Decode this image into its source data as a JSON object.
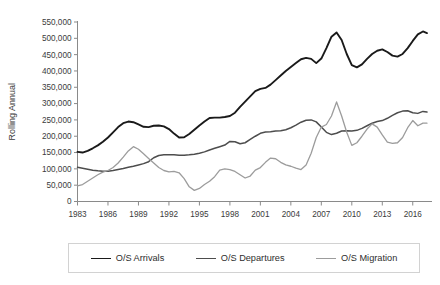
{
  "chart_data": {
    "type": "line",
    "title": "",
    "xlabel": "",
    "ylabel": "Rolling Annual",
    "ylim": [
      0,
      550000
    ],
    "xlim": [
      1983,
      2017.5
    ],
    "grid": false,
    "legend_position": "bottom",
    "y_ticks": [
      "0",
      "50,000",
      "100,000",
      "150,000",
      "200,000",
      "250,000",
      "300,000",
      "350,000",
      "400,000",
      "450,000",
      "500,000",
      "550,000"
    ],
    "y_tick_values": [
      0,
      50000,
      100000,
      150000,
      200000,
      250000,
      300000,
      350000,
      400000,
      450000,
      500000,
      550000
    ],
    "x_ticks": [
      "1983",
      "1986",
      "1989",
      "1992",
      "1995",
      "1998",
      "2001",
      "2004",
      "2007",
      "2010",
      "2013",
      "2016"
    ],
    "x_tick_values": [
      1983,
      1986,
      1989,
      1992,
      1995,
      1998,
      2001,
      2004,
      2007,
      2010,
      2013,
      2016
    ],
    "series": [
      {
        "name": "O/S Arrivals",
        "color": "#1a1a1a",
        "width": 1.9,
        "x": [
          1983.0,
          1983.5,
          1984.0,
          1984.5,
          1985.0,
          1985.5,
          1986.0,
          1986.5,
          1987.0,
          1987.5,
          1988.0,
          1988.5,
          1989.0,
          1989.5,
          1990.0,
          1990.5,
          1991.0,
          1991.5,
          1992.0,
          1992.5,
          1993.0,
          1993.5,
          1994.0,
          1994.5,
          1995.0,
          1995.5,
          1996.0,
          1996.5,
          1997.0,
          1997.5,
          1998.0,
          1998.5,
          1999.0,
          1999.5,
          2000.0,
          2000.5,
          2001.0,
          2001.5,
          2002.0,
          2002.5,
          2003.0,
          2003.5,
          2004.0,
          2004.5,
          2005.0,
          2005.5,
          2006.0,
          2006.5,
          2007.0,
          2007.5,
          2008.0,
          2008.5,
          2009.0,
          2009.5,
          2010.0,
          2010.5,
          2011.0,
          2011.5,
          2012.0,
          2012.5,
          2013.0,
          2013.5,
          2014.0,
          2014.5,
          2015.0,
          2015.5,
          2016.0,
          2016.5,
          2017.0,
          2017.4
        ],
        "y": [
          152000,
          150000,
          155000,
          163000,
          172000,
          183000,
          196000,
          212000,
          228000,
          240000,
          245000,
          243000,
          236000,
          229000,
          228000,
          232000,
          233000,
          230000,
          222000,
          208000,
          196000,
          197000,
          207000,
          220000,
          233000,
          245000,
          256000,
          257000,
          257000,
          259000,
          262000,
          272000,
          290000,
          306000,
          322000,
          338000,
          345000,
          348000,
          358000,
          372000,
          386000,
          400000,
          412000,
          424000,
          436000,
          440000,
          437000,
          424000,
          438000,
          470000,
          505000,
          518000,
          495000,
          452000,
          418000,
          411000,
          420000,
          437000,
          452000,
          462000,
          466000,
          458000,
          447000,
          444000,
          452000,
          470000,
          492000,
          512000,
          521000,
          516000
        ]
      },
      {
        "name": "O/S Departures",
        "color": "#4d4d4d",
        "width": 1.5,
        "x": [
          1983.0,
          1983.5,
          1984.0,
          1984.5,
          1985.0,
          1985.5,
          1986.0,
          1986.5,
          1987.0,
          1987.5,
          1988.0,
          1988.5,
          1989.0,
          1989.5,
          1990.0,
          1990.5,
          1991.0,
          1991.5,
          1992.0,
          1992.5,
          1993.0,
          1993.5,
          1994.0,
          1994.5,
          1995.0,
          1995.5,
          1996.0,
          1996.5,
          1997.0,
          1997.5,
          1998.0,
          1998.5,
          1999.0,
          1999.5,
          2000.0,
          2000.5,
          2001.0,
          2001.5,
          2002.0,
          2002.5,
          2003.0,
          2003.5,
          2004.0,
          2004.5,
          2005.0,
          2005.5,
          2006.0,
          2006.5,
          2007.0,
          2007.5,
          2008.0,
          2008.5,
          2009.0,
          2009.5,
          2010.0,
          2010.5,
          2011.0,
          2011.5,
          2012.0,
          2012.5,
          2013.0,
          2013.5,
          2014.0,
          2014.5,
          2015.0,
          2015.5,
          2016.0,
          2016.5,
          2017.0,
          2017.4
        ],
        "y": [
          105000,
          102000,
          99000,
          96000,
          94000,
          93000,
          93000,
          95000,
          98000,
          101000,
          105000,
          108000,
          112000,
          116000,
          122000,
          134000,
          141000,
          143000,
          143000,
          143000,
          142000,
          142000,
          143000,
          145000,
          148000,
          152000,
          158000,
          163000,
          168000,
          173000,
          184000,
          183000,
          177000,
          180000,
          190000,
          200000,
          209000,
          213000,
          214000,
          216000,
          217000,
          220000,
          226000,
          234000,
          243000,
          249000,
          250000,
          244000,
          228000,
          212000,
          205000,
          209000,
          216000,
          217000,
          216000,
          218000,
          224000,
          232000,
          240000,
          245000,
          248000,
          255000,
          264000,
          272000,
          277000,
          278000,
          272000,
          270000,
          276000,
          274000
        ]
      },
      {
        "name": "O/S Migration",
        "color": "#9c9c9c",
        "width": 1.3,
        "x": [
          1983.0,
          1983.5,
          1984.0,
          1984.5,
          1985.0,
          1985.5,
          1986.0,
          1986.5,
          1987.0,
          1987.5,
          1988.0,
          1988.5,
          1989.0,
          1989.5,
          1990.0,
          1990.5,
          1991.0,
          1991.5,
          1992.0,
          1992.5,
          1993.0,
          1993.5,
          1994.0,
          1994.5,
          1995.0,
          1995.5,
          1996.0,
          1996.5,
          1997.0,
          1997.5,
          1998.0,
          1998.5,
          1999.0,
          1999.5,
          2000.0,
          2000.5,
          2001.0,
          2001.5,
          2002.0,
          2002.5,
          2003.0,
          2003.5,
          2004.0,
          2004.5,
          2005.0,
          2005.5,
          2006.0,
          2006.5,
          2007.0,
          2007.5,
          2008.0,
          2008.5,
          2009.0,
          2009.5,
          2010.0,
          2010.5,
          2011.0,
          2011.5,
          2012.0,
          2012.5,
          2013.0,
          2013.5,
          2014.0,
          2014.5,
          2015.0,
          2015.5,
          2016.0,
          2016.5,
          2017.0,
          2017.4
        ],
        "y": [
          48000,
          52000,
          62000,
          72000,
          82000,
          90000,
          95000,
          104000,
          118000,
          136000,
          155000,
          168000,
          160000,
          146000,
          132000,
          118000,
          104000,
          95000,
          91000,
          92000,
          88000,
          70000,
          45000,
          34000,
          40000,
          52000,
          62000,
          76000,
          96000,
          100000,
          98000,
          92000,
          82000,
          72000,
          78000,
          96000,
          104000,
          120000,
          133000,
          131000,
          120000,
          112000,
          108000,
          102000,
          98000,
          112000,
          148000,
          196000,
          228000,
          236000,
          262000,
          305000,
          262000,
          212000,
          172000,
          180000,
          200000,
          222000,
          238000,
          228000,
          204000,
          182000,
          178000,
          180000,
          196000,
          226000,
          248000,
          232000,
          240000,
          240000
        ]
      }
    ]
  },
  "legend": {
    "items": [
      {
        "label": "O/S Arrivals",
        "color": "#1a1a1a",
        "width": "1.9px"
      },
      {
        "label": "O/S Departures",
        "color": "#4d4d4d",
        "width": "1.5px"
      },
      {
        "label": "O/S Migration",
        "color": "#9c9c9c",
        "width": "1.3px"
      }
    ]
  },
  "axes": {
    "y_title": "Rolling Annual"
  },
  "colors": {
    "axis": "#8a8a8a",
    "tick_text": "#3b3b3b",
    "legend_border": "#d2d2d2",
    "background": "#ffffff"
  }
}
